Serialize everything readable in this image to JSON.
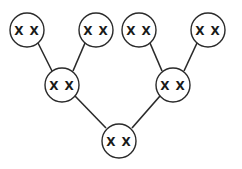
{
  "diagram": {
    "type": "binary-tree",
    "nodes": [
      {
        "id": "top-1",
        "label": "X X",
        "cx": 27,
        "cy": 30
      },
      {
        "id": "top-2",
        "label": "X X",
        "cx": 96,
        "cy": 30
      },
      {
        "id": "top-3",
        "label": "X X",
        "cx": 139,
        "cy": 30
      },
      {
        "id": "top-4",
        "label": "X X",
        "cx": 208,
        "cy": 30
      },
      {
        "id": "mid-1",
        "label": "X X",
        "cx": 62,
        "cy": 85
      },
      {
        "id": "mid-2",
        "label": "X X",
        "cx": 173,
        "cy": 85
      },
      {
        "id": "bottom",
        "label": "X X",
        "cx": 119,
        "cy": 141
      }
    ],
    "edges": [
      [
        "top-1",
        "mid-1"
      ],
      [
        "top-2",
        "mid-1"
      ],
      [
        "top-3",
        "mid-2"
      ],
      [
        "top-4",
        "mid-2"
      ],
      [
        "mid-1",
        "bottom"
      ],
      [
        "mid-2",
        "bottom"
      ]
    ],
    "node_radius": 17,
    "stroke_color": "#2a2a2a"
  }
}
